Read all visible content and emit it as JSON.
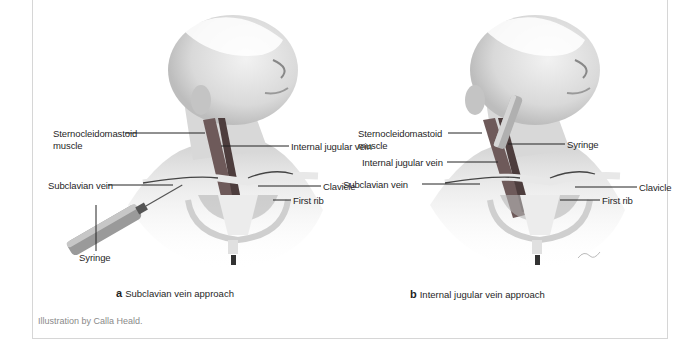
{
  "figure": {
    "panels": [
      {
        "id": "a",
        "letter": "a",
        "caption": "Subclavian vein approach",
        "labels": {
          "scm": "Sternocleidomastoid",
          "scm2": "muscle",
          "ijv": "Internal jugular vein",
          "subclavian": "Subclavian vein",
          "clavicle": "Clavicle",
          "first_rib": "First rib",
          "syringe": "Syringe"
        }
      },
      {
        "id": "b",
        "letter": "b",
        "caption": "Internal jugular vein approach",
        "labels": {
          "scm": "Sternocleidomastoid",
          "scm2": "muscle",
          "syringe": "Syringe",
          "ijv": "Internal jugular vein",
          "subclavian": "Subclavian vein",
          "clavicle": "Clavicle",
          "first_rib": "First rib"
        }
      }
    ],
    "credit": "Illustration by Calla Heald."
  }
}
